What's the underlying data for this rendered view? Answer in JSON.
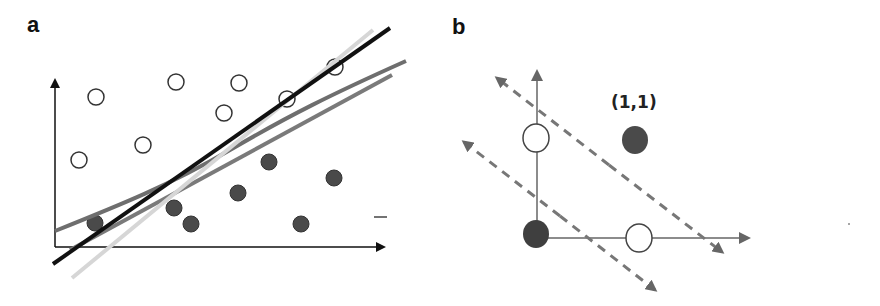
{
  "panels": {
    "a": {
      "label": "a",
      "description": "Scatter of two classes (open and filled circles) with several candidate separating lines",
      "open_points": [
        [
          96,
          97
        ],
        [
          176,
          82
        ],
        [
          239,
          83
        ],
        [
          224,
          113
        ],
        [
          287,
          99
        ],
        [
          335,
          67
        ],
        [
          143,
          145
        ],
        [
          79,
          160
        ]
      ],
      "filled_points": [
        [
          95,
          223
        ],
        [
          174,
          208
        ],
        [
          191,
          224
        ],
        [
          238,
          193
        ],
        [
          269,
          162
        ],
        [
          334,
          178
        ],
        [
          301,
          224
        ]
      ],
      "lines": [
        {
          "name": "black-line",
          "color": "#111111",
          "width": 4,
          "from": [
            53,
            264
          ],
          "to": [
            390,
            28
          ]
        },
        {
          "name": "light-gray-line",
          "color": "#d6d6d6",
          "width": 4,
          "from": [
            72,
            278
          ],
          "to": [
            373,
            30
          ]
        },
        {
          "name": "gray-curved-line",
          "color": "#6e6e6e",
          "width": 4,
          "path": "M55,231 C120,205 170,185 230,150 S330,95 406,61"
        },
        {
          "name": "gray-straight-line",
          "color": "#7a7a7a",
          "width": 4,
          "from": [
            70,
            250
          ],
          "to": [
            392,
            75
          ]
        }
      ],
      "dash_mark": {
        "x1": 374,
        "y1": 217,
        "x2": 387,
        "y2": 217
      }
    },
    "b": {
      "label": "b",
      "description": "XOR-style arrangement: four points at unit square corners with two dashed parallel boundaries",
      "point_label": "(1,1)",
      "points": [
        {
          "name": "point-0-1",
          "type": "open",
          "cx": 536,
          "cy": 138
        },
        {
          "name": "point-1-1",
          "type": "filled",
          "cx": 635,
          "cy": 140
        },
        {
          "name": "point-0-0",
          "type": "filled",
          "cx": 536,
          "cy": 235
        },
        {
          "name": "point-1-0",
          "type": "open",
          "cx": 639,
          "cy": 238
        }
      ],
      "dashed_boundaries": [
        {
          "name": "upper-boundary",
          "from": [
            497,
            78
          ],
          "to": [
            722,
            252
          ]
        },
        {
          "name": "lower-boundary",
          "from": [
            464,
            142
          ],
          "to": [
            655,
            290
          ]
        }
      ]
    }
  },
  "colors": {
    "axis": "#111111",
    "axis_b": "#666666",
    "filled_point": "#4a4a4a",
    "open_point_stroke": "#333333",
    "dashed": "#777777"
  }
}
